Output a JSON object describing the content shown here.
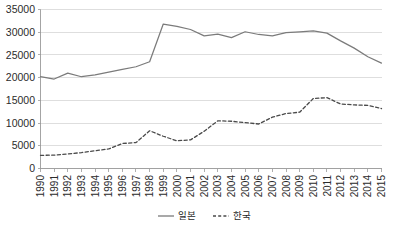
{
  "chart_data": {
    "type": "line",
    "title": "",
    "subtitle": "",
    "xlabel": "",
    "ylabel": "",
    "grid": "horizontal",
    "legend_position": "bottom",
    "ylim": [
      0,
      35000
    ],
    "ytick_labels": [
      "0",
      "5000",
      "10000",
      "15000",
      "20000",
      "25000",
      "30000",
      "35000"
    ],
    "ytick_values": [
      0,
      5000,
      10000,
      15000,
      20000,
      25000,
      30000,
      35000
    ],
    "categories": [
      "1990",
      "1991",
      "1992",
      "1993",
      "1994",
      "1995",
      "1996",
      "1997",
      "1998",
      "1999",
      "2000",
      "2001",
      "2002",
      "2003",
      "2004",
      "2005",
      "2006",
      "2007",
      "2008",
      "2009",
      "2010",
      "2011",
      "2012",
      "2013",
      "2014",
      "2015"
    ],
    "series": [
      {
        "name": "일본",
        "style": "solid",
        "color": "#7b7b7b",
        "values": [
          20200,
          19700,
          21000,
          20200,
          20600,
          21200,
          21800,
          22400,
          23500,
          31800,
          31300,
          30600,
          29200,
          29600,
          28800,
          30100,
          29500,
          29200,
          29900,
          30100,
          30300,
          29800,
          28100,
          26500,
          24600,
          23200
        ]
      },
      {
        "name": "한국",
        "style": "dashed",
        "color": "#4a4a4a",
        "values": [
          2900,
          2950,
          3200,
          3500,
          3900,
          4300,
          5500,
          5700,
          8300,
          7100,
          6100,
          6300,
          8200,
          10500,
          10400,
          10100,
          9800,
          11300,
          12100,
          12400,
          15400,
          15600,
          14200,
          14000,
          13900,
          13200
        ]
      }
    ]
  },
  "legend": {
    "items": [
      {
        "label": "일본",
        "style": "solid"
      },
      {
        "label": "한국",
        "style": "dashed"
      }
    ]
  }
}
